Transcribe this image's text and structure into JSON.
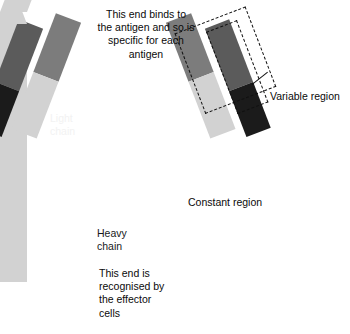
{
  "diagram": {
    "captions": {
      "top": "This end binds to\nthe antigen and so is\nspecific for each\nantigen",
      "bottom": "This end is\nrecognised by\nthe effector\ncells"
    },
    "labels": {
      "variable_region": "Variable region",
      "constant_region": "Constant region",
      "light_chain": "Light\nchain",
      "heavy_chain": "Heavy\nchain"
    },
    "colors": {
      "background": "#ffffff",
      "variable_heavy_gray": "#7c7c7c",
      "variable_light_gray": "#5b5b5b",
      "constant_light_gray": "#d2d2d2",
      "constant_dark": "#1b1b1b",
      "outline_dashed": "#111111",
      "text_dark": "#0a0a0a",
      "text_light": "#f2f2f2"
    },
    "annotations": {
      "dashed_boxes": 2,
      "arms": 2,
      "stems": 2
    }
  }
}
